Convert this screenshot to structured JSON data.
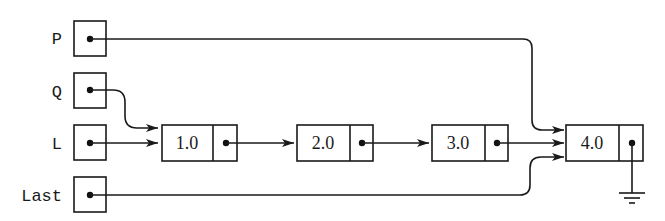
{
  "diagram": {
    "type": "linked-list",
    "pointers": [
      {
        "name": "P",
        "target": "node-4"
      },
      {
        "name": "Q",
        "target": "node-1"
      },
      {
        "name": "L",
        "target": "node-1"
      },
      {
        "name": "Last",
        "target": "node-4"
      }
    ],
    "nodes": [
      {
        "value": "1.0",
        "next": "node-2"
      },
      {
        "value": "2.0",
        "next": "node-3"
      },
      {
        "value": "3.0",
        "next": "node-4"
      },
      {
        "value": "4.0",
        "next": "null"
      }
    ],
    "null_symbol": "ground-icon"
  }
}
